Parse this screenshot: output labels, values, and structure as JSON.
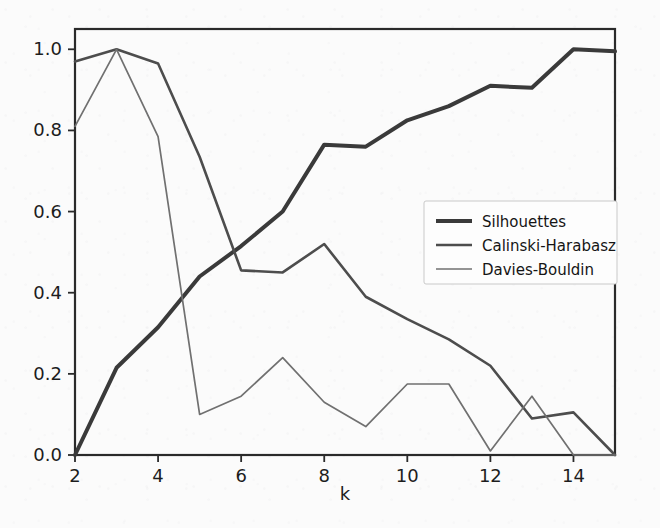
{
  "chart_data": {
    "type": "line",
    "title": "",
    "xlabel": "k",
    "ylabel": "",
    "x": [
      2,
      3,
      4,
      5,
      6,
      7,
      8,
      9,
      10,
      11,
      12,
      13,
      14,
      15
    ],
    "xlim": [
      2,
      15
    ],
    "ylim": [
      0.0,
      1.05
    ],
    "grid": false,
    "legend_position": "center-right",
    "xticks": [
      "2",
      "4",
      "6",
      "8",
      "10",
      "12",
      "14"
    ],
    "xtick_values": [
      2,
      4,
      6,
      8,
      10,
      12,
      14
    ],
    "yticks": [
      "0.0",
      "0.2",
      "0.4",
      "0.6",
      "0.8",
      "1.0"
    ],
    "ytick_values": [
      0.0,
      0.2,
      0.4,
      0.6,
      0.8,
      1.0
    ],
    "series": [
      {
        "name": "Silhouettes",
        "color": "#3a3a3a",
        "linewidth": 4.0,
        "values": [
          0.0,
          0.215,
          0.315,
          0.44,
          0.515,
          0.6,
          0.765,
          0.76,
          0.825,
          0.86,
          0.91,
          0.905,
          1.0,
          0.995
        ]
      },
      {
        "name": "Calinski-Harabasz",
        "color": "#4d4d4d",
        "linewidth": 2.6,
        "values": [
          0.97,
          1.0,
          0.965,
          0.735,
          0.455,
          0.45,
          0.52,
          0.39,
          0.335,
          0.285,
          0.22,
          0.09,
          0.105,
          0.0
        ]
      },
      {
        "name": "Davies-Bouldin",
        "color": "#707070",
        "linewidth": 1.7,
        "values": [
          0.81,
          1.0,
          0.785,
          0.1,
          0.145,
          0.24,
          0.13,
          0.07,
          0.175,
          0.175,
          0.01,
          0.145,
          0.0,
          0.0
        ]
      }
    ]
  },
  "legend": {
    "entries": [
      {
        "label": "Silhouettes"
      },
      {
        "label": "Calinski-Harabasz"
      },
      {
        "label": "Davies-Bouldin"
      }
    ]
  },
  "axes": {
    "x_label": "k",
    "spine_color": "#2a2a2a",
    "background": "#fbfbfb"
  }
}
